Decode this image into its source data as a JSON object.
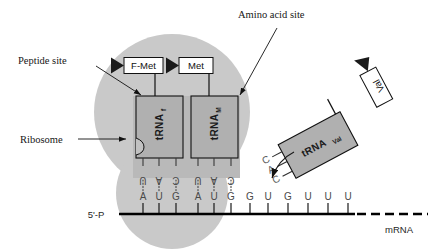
{
  "figure": {
    "type": "diagram",
    "background_color": "#ffffff"
  },
  "callouts": [
    {
      "id": "amino-acid-site",
      "label": "Amino acid site",
      "x": 238,
      "y": 18
    },
    {
      "id": "peptide-site",
      "label": "Peptide site",
      "x": 18,
      "y": 62
    },
    {
      "id": "ribosome",
      "label": "Ribosome",
      "x": 20,
      "y": 142
    }
  ],
  "ribosome": {
    "name": "Ribosome",
    "fill_color": "#c9c9c9",
    "large_subunit": {
      "cx": 172,
      "cy": 112,
      "r": 78
    },
    "small_subunit": {
      "cx": 172,
      "cy": 192,
      "r": 55
    }
  },
  "amino_acids": [
    {
      "id": "f-met",
      "label": "F-Met",
      "arrow": "left-arrow",
      "x": 124,
      "y": 58,
      "w": 38,
      "h": 15
    },
    {
      "id": "met",
      "label": "Met",
      "arrow": "left-arrow",
      "x": 179,
      "y": 58,
      "w": 33,
      "h": 15
    }
  ],
  "trnas": [
    {
      "id": "trna-f",
      "base_label": "tRNA",
      "subscript": "f",
      "site": "peptide site",
      "anticodon": [
        "U",
        "A",
        "C"
      ],
      "fill_color": "#b0b0b0",
      "x": 136,
      "y": 96,
      "w": 46,
      "h": 62
    },
    {
      "id": "trna-m",
      "base_label": "tRNA",
      "subscript": "M",
      "site": "amino acid site",
      "anticodon": [
        "U",
        "A",
        "C"
      ],
      "fill_color": "#b0b0b0",
      "x": 191,
      "y": 96,
      "w": 46,
      "h": 62
    },
    {
      "id": "trna-val",
      "base_label": "tRNA",
      "subscript": "Val",
      "site": "incoming",
      "anticodon": [
        "C",
        "A",
        "C"
      ],
      "amino_acid": "Val",
      "fill_color": "#b0b0b0",
      "rotation_deg": -28
    }
  ],
  "mrna": {
    "label": "mRNA",
    "five_prime_label": "5'-P",
    "sequence": [
      "A",
      "U",
      "G",
      "A",
      "U",
      "G",
      "G",
      "U",
      "G",
      "U",
      "U",
      "U"
    ],
    "codons": [
      "AUG",
      "AUG",
      "GUG",
      "UUU"
    ],
    "continuation": "dashed",
    "strand_color": "#000000"
  },
  "pairing": {
    "hydrogen_bond_style": "vertical dots",
    "paired_positions": [
      0,
      1,
      2,
      3,
      4,
      5
    ]
  },
  "annotations": {
    "incoming_arrow": "curved-arrow-to-codon",
    "val_arrow": "up-arrow"
  }
}
